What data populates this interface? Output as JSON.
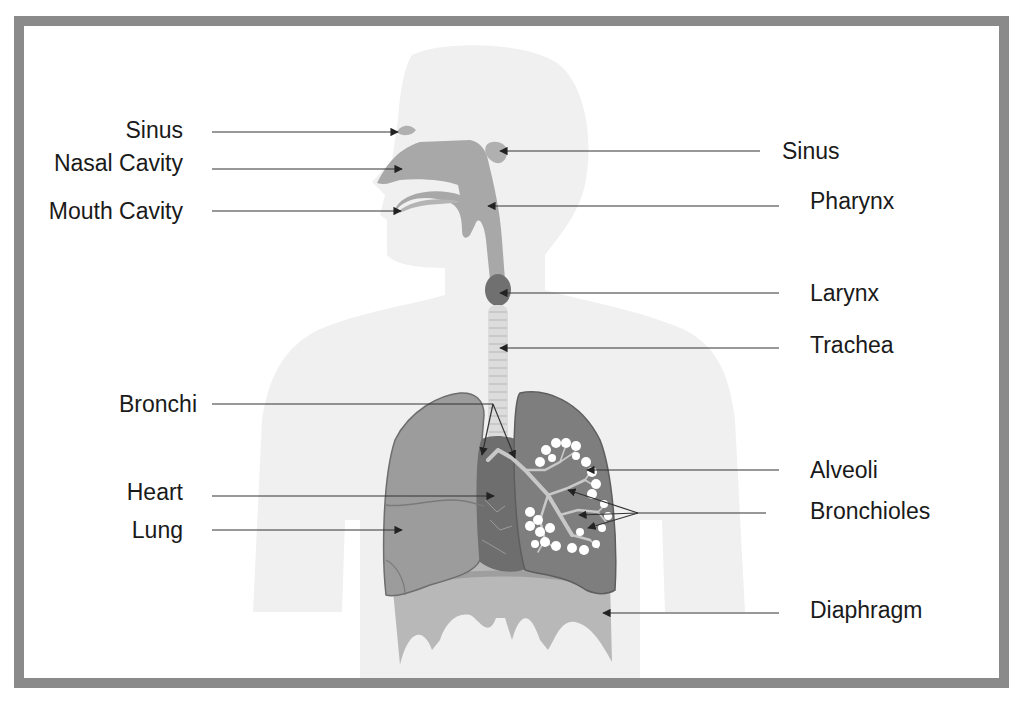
{
  "diagram": {
    "colors": {
      "frame": "#8a8a8a",
      "background": "#ffffff",
      "silhouette": "#f0f0f0",
      "airway": "#a8a8a8",
      "lung_left": "#9a9a9a",
      "lung_right": "#7e7e7e",
      "heart": "#6e6e6e",
      "diaphragm": "#b4b4b4",
      "label_text": "#1a1a1a",
      "leader_line": "#333333"
    },
    "labels_left": [
      {
        "id": "sinus-left",
        "text": "Sinus",
        "x": 183,
        "y": 130
      },
      {
        "id": "nasal-cavity",
        "text": "Nasal Cavity",
        "x": 183,
        "y": 163
      },
      {
        "id": "mouth-cavity",
        "text": "Mouth Cavity",
        "x": 183,
        "y": 211
      },
      {
        "id": "bronchi",
        "text": "Bronchi",
        "x": 197,
        "y": 405
      },
      {
        "id": "heart",
        "text": "Heart",
        "x": 183,
        "y": 492
      },
      {
        "id": "lung",
        "text": "Lung",
        "x": 183,
        "y": 530
      }
    ],
    "labels_right": [
      {
        "id": "sinus-right",
        "text": "Sinus",
        "x": 782,
        "y": 151
      },
      {
        "id": "pharynx",
        "text": "Pharynx",
        "x": 810,
        "y": 201
      },
      {
        "id": "larynx",
        "text": "Larynx",
        "x": 810,
        "y": 293
      },
      {
        "id": "trachea",
        "text": "Trachea",
        "x": 810,
        "y": 345
      },
      {
        "id": "alveoli",
        "text": "Alveoli",
        "x": 810,
        "y": 470
      },
      {
        "id": "bronchioles",
        "text": "Bronchioles",
        "x": 810,
        "y": 512
      },
      {
        "id": "diaphragm",
        "text": "Diaphragm",
        "x": 810,
        "y": 610
      }
    ]
  }
}
